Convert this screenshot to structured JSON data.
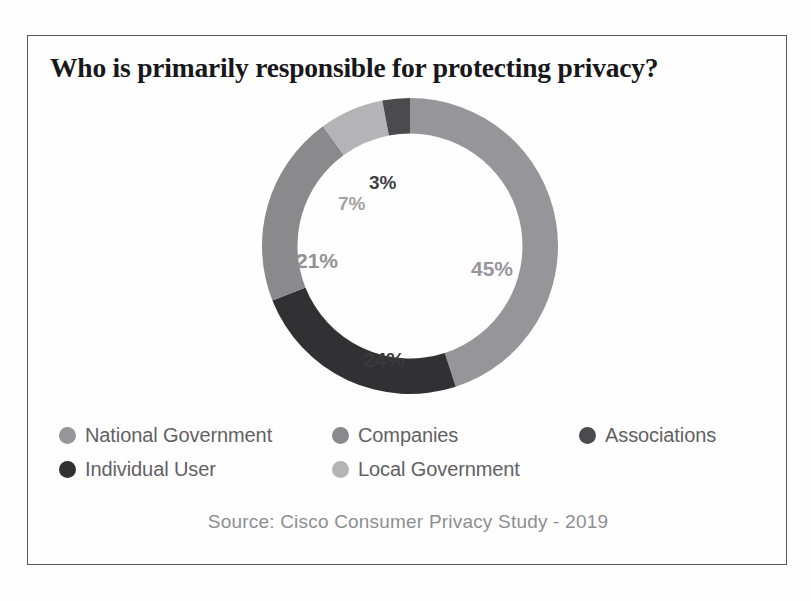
{
  "figure": {
    "title": "Who is primarily responsible for protecting privacy?",
    "source": "Source: Cisco Consumer Privacy Study - 2019"
  },
  "legend": {
    "rows": [
      [
        {
          "label": "National Government",
          "color": "#96969a"
        },
        {
          "label": "Companies",
          "color": "#8a8a8d"
        },
        {
          "label": "Associations",
          "color": "#4b4b4e"
        }
      ],
      [
        {
          "label": "Individual User",
          "color": "#313133"
        },
        {
          "label": "Local Government",
          "color": "#b4b4b6"
        }
      ]
    ]
  },
  "labels": {
    "associations": "3%",
    "local_government": "7%",
    "companies": "21%",
    "national_government": "45%",
    "individual_user": "24%"
  },
  "chart_data": {
    "type": "pie",
    "variant": "donut",
    "title": "Who is primarily responsible for protecting privacy?",
    "subtitle": "",
    "source": "Source: Cisco Consumer Privacy Study - 2019",
    "unit": "percent",
    "total": 100,
    "start_angle_deg": 0,
    "direction": "clockwise",
    "inner_radius_ratio": 0.76,
    "legend_position": "bottom",
    "grid": false,
    "categories": [
      "National Government",
      "Individual User",
      "Companies",
      "Local Government",
      "Associations"
    ],
    "values": [
      45,
      24,
      21,
      7,
      3
    ],
    "data_labels": [
      "45%",
      "24%",
      "21%",
      "7%",
      "3%"
    ],
    "colors": [
      "#96969a",
      "#313133",
      "#8a8a8d",
      "#b4b4b6",
      "#4b4b4e"
    ],
    "slices": [
      {
        "name": "National Government",
        "value": 45,
        "label": "45%",
        "color": "#96969a"
      },
      {
        "name": "Individual User",
        "value": 24,
        "label": "24%",
        "color": "#313133"
      },
      {
        "name": "Companies",
        "value": 21,
        "label": "21%",
        "color": "#8a8a8d"
      },
      {
        "name": "Local Government",
        "value": 7,
        "label": "7%",
        "color": "#b4b4b6"
      },
      {
        "name": "Associations",
        "value": 3,
        "label": "3%",
        "color": "#4b4b4e"
      }
    ]
  }
}
